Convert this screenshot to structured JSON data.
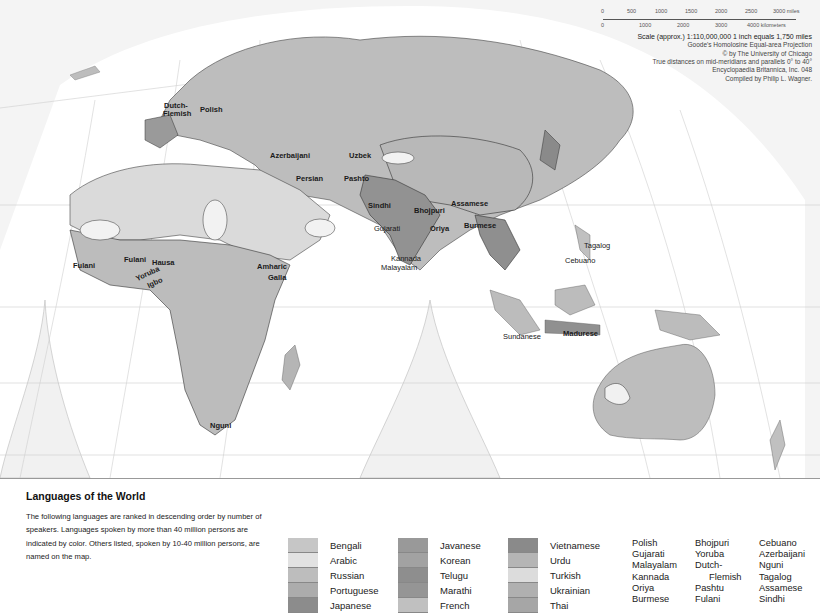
{
  "map": {
    "projection_note": "Goode's Homolosine Equal-area Projection",
    "scale": {
      "miles_ticks": [
        "0",
        "500",
        "1000",
        "1500",
        "2000",
        "2500",
        "3000 miles"
      ],
      "km_ticks": [
        "0",
        "1000",
        "2000",
        "3000",
        "4000 kilometers"
      ],
      "scale_line": "Scale (approx.) 1:110,000,000   1 inch equals 1,750 miles",
      "projection": "Goode's Homolosine Equal-area Projection",
      "copyright": "© by The University of Chicago",
      "distances": "True distances on mid-meridians and parallels 0° to 40°",
      "publisher": "Encyclopaedia Britannica, Inc. 048",
      "compiler": "Compiled by Philip L. Wagner."
    },
    "region_labels": [
      {
        "text": "Dutch-",
        "x": 164,
        "y": 102
      },
      {
        "text": "Flemish",
        "x": 163,
        "y": 110
      },
      {
        "text": "Polish",
        "x": 200,
        "y": 106
      },
      {
        "text": "Azerbaijani",
        "x": 270,
        "y": 152
      },
      {
        "text": "Uzbek",
        "x": 349,
        "y": 152
      },
      {
        "text": "Persian",
        "x": 296,
        "y": 175
      },
      {
        "text": "Pashto",
        "x": 344,
        "y": 175
      },
      {
        "text": "Sindhi",
        "x": 368,
        "y": 202
      },
      {
        "text": "Bhojpuri",
        "x": 414,
        "y": 207
      },
      {
        "text": "Assamese",
        "x": 451,
        "y": 200
      },
      {
        "text": "Gujarati",
        "x": 374,
        "y": 225
      },
      {
        "text": "Oriya",
        "x": 430,
        "y": 225
      },
      {
        "text": "Burmese",
        "x": 464,
        "y": 222
      },
      {
        "text": "Kannada",
        "x": 391,
        "y": 255
      },
      {
        "text": "Malayalam",
        "x": 381,
        "y": 264
      },
      {
        "text": "Tagalog",
        "x": 584,
        "y": 242
      },
      {
        "text": "Cebuano",
        "x": 565,
        "y": 257
      },
      {
        "text": "Sundanese",
        "x": 503,
        "y": 333
      },
      {
        "text": "Madurese",
        "x": 563,
        "y": 330
      },
      {
        "text": "Fulani",
        "x": 73,
        "y": 262
      },
      {
        "text": "Fulani",
        "x": 124,
        "y": 256
      },
      {
        "text": "Hausa",
        "x": 152,
        "y": 259
      },
      {
        "text": "Yoruba",
        "x": 135,
        "y": 270
      },
      {
        "text": "Igbo",
        "x": 147,
        "y": 279
      },
      {
        "text": "Amharic",
        "x": 257,
        "y": 263
      },
      {
        "text": "Galla",
        "x": 268,
        "y": 274
      },
      {
        "text": "Nguni",
        "x": 210,
        "y": 422
      }
    ],
    "grid_labels": [
      "60",
      "40",
      "20",
      "0",
      "20",
      "40",
      "60",
      "80",
      "140",
      "160"
    ]
  },
  "legend": {
    "title": "Languages of the World",
    "description": "The following languages are ranked in descending order by number of speakers. Languages spoken by more than 40 million persons are indicated by color. Others listed, spoken by 10-40 million persons, are named on the map.",
    "color_columns": [
      [
        {
          "label": "Bengali",
          "color": "#c6c6c6"
        },
        {
          "label": "Arabic",
          "color": "#e2e2e2"
        },
        {
          "label": "Russian",
          "color": "#bdbdbd"
        },
        {
          "label": "Portuguese",
          "color": "#acacac"
        },
        {
          "label": "Japanese",
          "color": "#8c8c8c"
        }
      ],
      [
        {
          "label": "Javanese",
          "color": "#999999"
        },
        {
          "label": "Korean",
          "color": "#a2a2a2"
        },
        {
          "label": "Telugu",
          "color": "#8e8e8e"
        },
        {
          "label": "Marathi",
          "color": "#959595"
        },
        {
          "label": "French",
          "color": "#c0c0c0"
        }
      ],
      [
        {
          "label": "Vietnamese",
          "color": "#8a8a8a"
        },
        {
          "label": "Urdu",
          "color": "#b5b5b5"
        },
        {
          "label": "Turkish",
          "color": "#dcdcdc"
        },
        {
          "label": "Ukrainian",
          "color": "#b0b0b0"
        },
        {
          "label": "Thai",
          "color": "#a6a6a6"
        }
      ]
    ],
    "named_columns": [
      [
        "Polish",
        "Gujarati",
        "Malayalam",
        "Kannada",
        "Oriya",
        "Burmese"
      ],
      [
        "Bhojpuri",
        "Yoruba",
        "Dutch-",
        "Flemish",
        "Pashtu",
        "Fulani"
      ],
      [
        "Cebuano",
        "Azerbaijani",
        "Nguni",
        "Tagalog",
        "Assamese",
        "Sindhi"
      ]
    ]
  },
  "colors": {
    "land_default": "#bdbdbd",
    "land_light": "#d9d9d9",
    "land_dark": "#8f8f8f",
    "ocean": "#ffffff",
    "interruption": "#f2f2f2",
    "border": "#3a3a3a"
  }
}
